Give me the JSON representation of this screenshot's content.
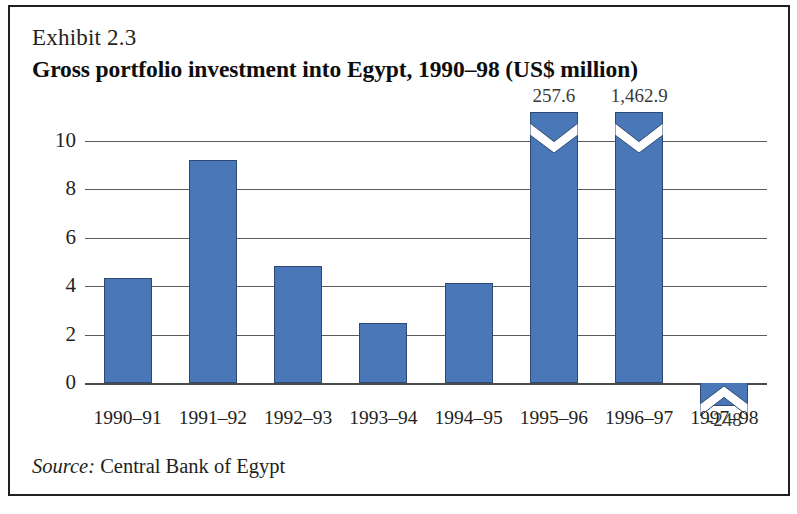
{
  "exhibit": {
    "label": "Exhibit 2.3",
    "title": "Gross portfolio investment into Egypt, 1990–98 (US$ million)"
  },
  "source": {
    "prefix": "Source:",
    "text": " Central Bank of Egypt"
  },
  "colors": {
    "bar_fill": "#4a77b8",
    "bar_stroke": "#2c4a74",
    "grid": "#5b5b5b",
    "text": "#231f20",
    "frame": "#231f20"
  },
  "chart_data": {
    "type": "bar",
    "title": "Gross portfolio investment into Egypt, 1990–98 (US$ million)",
    "xlabel": "",
    "ylabel": "",
    "ylim": [
      0,
      10
    ],
    "yticks": [
      0,
      2,
      4,
      6,
      8,
      10
    ],
    "ytick_labels": [
      "0",
      "2",
      "4",
      "6",
      "8",
      "10"
    ],
    "grid": true,
    "legend": "none",
    "units": "US$ million",
    "note": "Bars for 1995–96, 1996–97 and 1997–98 exceed the plotted axis range and are drawn with an axis-break chevron; their true values are shown as data labels.",
    "categories": [
      "1990–91",
      "1991–92",
      "1992–93",
      "1993–94",
      "1994–95",
      "1995–96",
      "1996–97",
      "1997–98"
    ],
    "values": [
      4.35,
      9.2,
      4.85,
      2.5,
      4.15,
      257.6,
      1462.9,
      -248
    ],
    "plotted_heights": [
      4.35,
      9.2,
      4.85,
      2.5,
      4.15,
      11.2,
      11.2,
      -0.95
    ],
    "broken_axis": [
      false,
      false,
      false,
      false,
      false,
      true,
      true,
      true
    ],
    "data_labels": [
      "",
      "",
      "",
      "",
      "",
      "257.6",
      "1,462.9",
      "-248"
    ]
  }
}
